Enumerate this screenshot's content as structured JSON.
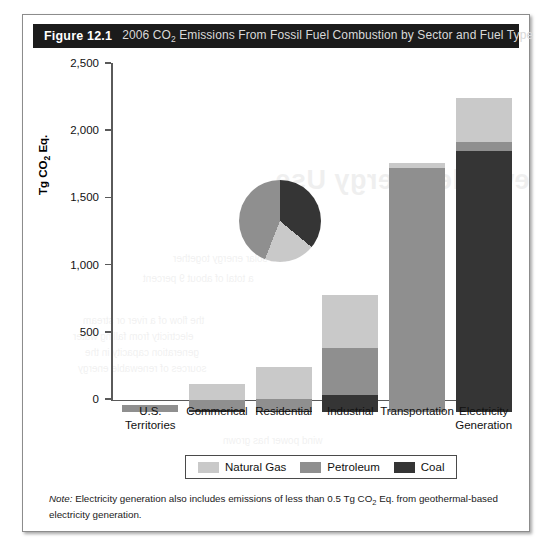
{
  "figure": {
    "number": "Figure 12.1",
    "title_prefix": "2006 CO",
    "title_sub": "2",
    "title_suffix": " Emissions From Fossil Fuel Combustion by Sector and Fuel Type",
    "note_label": "Note:",
    "note_part1": " Electricity generation also includes emissions of less than 0.5 Tg CO",
    "note_sub": "2",
    "note_part2": " Eq. from geothermal-based electricity generation."
  },
  "axis": {
    "y_title_prefix": "Tg CO",
    "y_title_sub": "2",
    "y_title_suffix": " Eq.",
    "ticks": [
      "0",
      "500",
      "1,000",
      "1,500",
      "2,000",
      "2,500"
    ]
  },
  "legend": {
    "items": [
      {
        "label": "Natural Gas",
        "color": "#c9c9c9"
      },
      {
        "label": "Petroleum",
        "color": "#8f8f8f"
      },
      {
        "label": "Coal",
        "color": "#353535"
      }
    ]
  },
  "colors": {
    "natural_gas": "#c9c9c9",
    "petroleum": "#8f8f8f",
    "coal": "#353535",
    "title_bar": "#1b1b1b",
    "axis": "#5a5a5a",
    "frame": "#8c8c8c"
  },
  "bleed": {
    "heading": "Renewable Energy Use",
    "lines": [
      "the flow of a river or stream",
      "electricity from falling water",
      "generation capacity in the",
      "sources of renewable energy",
      "a total of about 9 percent",
      "and solar energy together",
      "wind power has grown"
    ]
  },
  "chart_data": {
    "type": "bar",
    "subtype": "stacked",
    "title": "2006 CO2 Emissions From Fossil Fuel Combustion by Sector and Fuel Type",
    "xlabel": "",
    "ylabel": "Tg CO2 Eq.",
    "ylim": [
      0,
      2500
    ],
    "ytick_step": 500,
    "grid": false,
    "legend_position": "bottom",
    "categories": [
      "U.S. Territories",
      "Commerical",
      "Residential",
      "Industrial",
      "Transportation",
      "Electricity Generation"
    ],
    "category_labels_multiline": [
      [
        "U.S.",
        "Territories"
      ],
      [
        "Commerical"
      ],
      [
        "Residential"
      ],
      [
        "Industrial"
      ],
      [
        "Transportation"
      ],
      [
        "Electricity",
        "Generation"
      ]
    ],
    "series": [
      {
        "name": "Coal",
        "color": "#353535",
        "values": [
          0,
          10,
          5,
          125,
          0,
          1935
        ]
      },
      {
        "name": "Petroleum",
        "color": "#8f8f8f",
        "values": [
          48,
          75,
          90,
          350,
          1815,
          70
        ]
      },
      {
        "name": "Natural Gas",
        "color": "#c9c9c9",
        "values": [
          0,
          120,
          235,
          390,
          35,
          330
        ]
      }
    ],
    "totals": [
      48,
      205,
      330,
      865,
      1850,
      2335
    ],
    "stack_order_bottom_to_top": [
      "Coal",
      "Petroleum",
      "Natural Gas"
    ],
    "inset_pie": {
      "type": "pie",
      "labels": [
        "Coal",
        "Natural Gas",
        "Petroleum"
      ],
      "values": [
        36,
        20,
        44
      ],
      "colors": [
        "#353535",
        "#c9c9c9",
        "#8f8f8f"
      ],
      "start_angle_deg": 0
    }
  }
}
